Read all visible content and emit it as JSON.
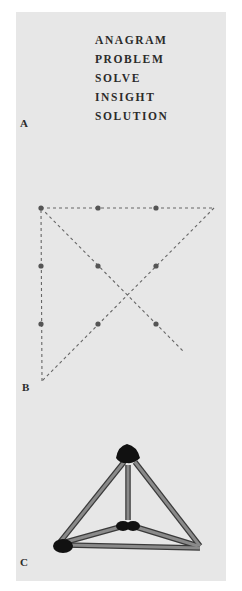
{
  "panel_a": {
    "label": "A",
    "words": [
      "ANAGRAM",
      "PROBLEM",
      "SOLVE",
      "INSIGHT",
      "SOLUTION"
    ]
  },
  "panel_b": {
    "label": "B",
    "description": "Nine-dot problem with solution: four connected straight lines passing through a 3x3 grid of dots",
    "dots": [
      {
        "row": 1,
        "col": 1
      },
      {
        "row": 1,
        "col": 2
      },
      {
        "row": 1,
        "col": 3
      },
      {
        "row": 2,
        "col": 1
      },
      {
        "row": 2,
        "col": 2
      },
      {
        "row": 2,
        "col": 3
      },
      {
        "row": 3,
        "col": 1
      },
      {
        "row": 3,
        "col": 2
      },
      {
        "row": 3,
        "col": 3
      }
    ],
    "line_style": "dashed"
  },
  "panel_c": {
    "label": "C",
    "description": "Six matchsticks forming a tetrahedron (triangular pyramid)",
    "matchstick_count": 6
  },
  "colors": {
    "page_background": "#ffffff",
    "panel_background": "#e7e7e7",
    "text": "#2b2b2b",
    "dot": "#555555",
    "dashed_line": "#666666",
    "matchstick_body": "#8a8a8a",
    "matchstick_edge": "#3a3a3a",
    "match_head": "#111111"
  }
}
